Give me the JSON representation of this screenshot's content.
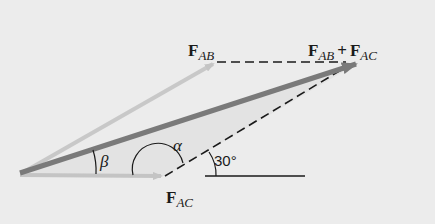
{
  "diagram": {
    "labels": {
      "f_ab": {
        "main": "F",
        "sub": "AB"
      },
      "f_ac": {
        "main": "F",
        "sub": "AC"
      },
      "resultant": {
        "a_main": "F",
        "a_sub": "AB",
        "plus": "+",
        "b_main": "F",
        "b_sub": "AC"
      },
      "alpha": "α",
      "beta": "β",
      "angle_30": "30°"
    },
    "colors": {
      "background": "#ececec",
      "f_ab_vector": "#c8c8c8",
      "f_ac_vector": "#c4c4c4",
      "resultant_vector": "#7a7a7a",
      "dashed_lines": "#1a1a1a",
      "shading": "#e2e2e2"
    }
  }
}
